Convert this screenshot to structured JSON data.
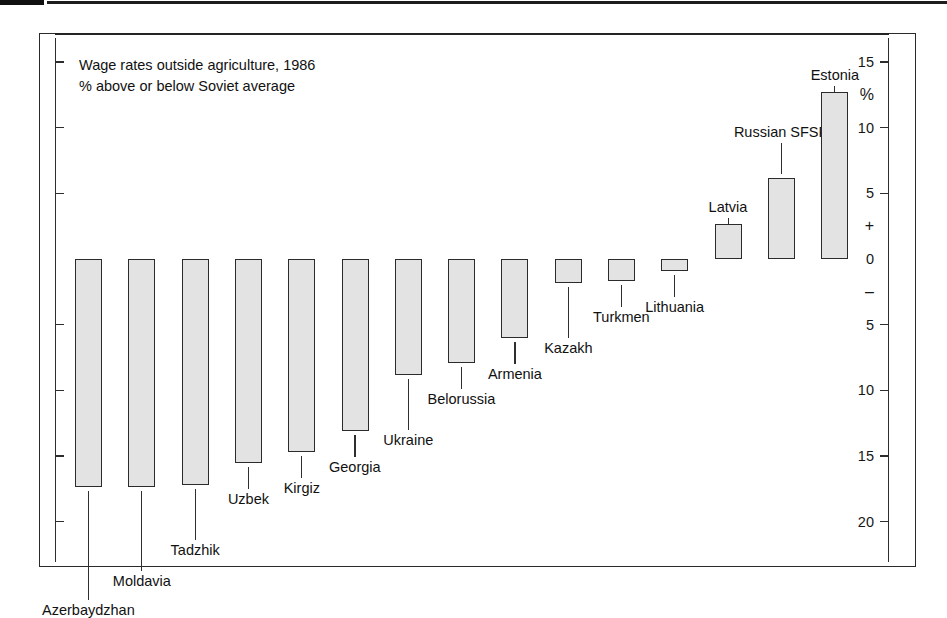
{
  "caption": {
    "line1": "Wage rates outside agriculture, 1986",
    "line2": "% above or below Soviet average"
  },
  "axis": {
    "unit_symbol": "%",
    "positive_symbol": "+",
    "negative_symbol": "–",
    "ticks": [
      "15",
      "10",
      "5",
      "0",
      "5",
      "10",
      "15",
      "20"
    ]
  },
  "chart_data": {
    "type": "bar",
    "title": "Wage rates outside agriculture, 1986",
    "subtitle": "% above or below Soviet average",
    "xlabel": "",
    "ylabel": "%",
    "ylim": [
      -21,
      16
    ],
    "grid": false,
    "legend": "none",
    "orientation": "vertical",
    "zero_baseline": 0,
    "categories": [
      "Azerbaydzhan",
      "Moldavia",
      "Tadzhik",
      "Uzbek",
      "Kirgiz",
      "Georgia",
      "Ukraine",
      "Belorussia",
      "Armenia",
      "Kazakh",
      "Turkmen",
      "Lithuania",
      "Latvia",
      "Russian SFSR",
      "Estonia"
    ],
    "values": [
      -17.4,
      -17.4,
      -17.2,
      -15.5,
      -14.7,
      -13.1,
      -8.8,
      -7.9,
      -6.0,
      -1.8,
      -1.7,
      -0.9,
      2.7,
      6.2,
      12.7
    ],
    "bars": [
      {
        "label": "Azerbaydzhan",
        "value": -17.4,
        "label_row": 3
      },
      {
        "label": "Moldavia",
        "value": -17.4,
        "label_row": 2
      },
      {
        "label": "Tadzhik",
        "value": -17.2,
        "label_row": 1
      },
      {
        "label": "Uzbek",
        "value": -15.5,
        "label_row": 0
      },
      {
        "label": "Kirgiz",
        "value": -14.7,
        "label_row": 0
      },
      {
        "label": "Georgia",
        "value": -13.1,
        "label_row": 0
      },
      {
        "label": "Ukraine",
        "value": -8.8,
        "label_row": 1
      },
      {
        "label": "Belorussia",
        "value": -7.9,
        "label_row": 0
      },
      {
        "label": "Armenia",
        "value": -6.0,
        "label_row": 0
      },
      {
        "label": "Kazakh",
        "value": -1.8,
        "label_row": 1
      },
      {
        "label": "Turkmen",
        "value": -1.7,
        "label_row": 0
      },
      {
        "label": "Lithuania",
        "value": -0.9,
        "label_row": 0
      },
      {
        "label": "Latvia",
        "value": 2.7,
        "label_row": 0
      },
      {
        "label": "Russian SFSR",
        "value": 6.2,
        "label_row": 1
      },
      {
        "label": "Estonia",
        "value": 12.7,
        "label_row": 0
      }
    ],
    "colors": {
      "bar_fill": "#e3e3e3",
      "bar_stroke": "#2b2b2b",
      "axis": "#2d2d2d",
      "text": "#111111",
      "background": "#ffffff"
    }
  }
}
